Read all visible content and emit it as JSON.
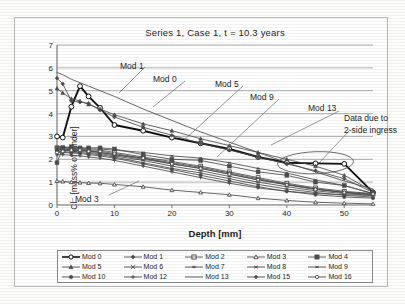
{
  "chart_data": {
    "type": "line",
    "title": "Series 1, Case 1, t = 10.3 years",
    "xlabel": "Depth [mm]",
    "ylabel": "Cl⁻ [mass% of binder]",
    "xlim": [
      0,
      55
    ],
    "ylim": [
      0,
      7
    ],
    "xticks": [
      0,
      10,
      20,
      30,
      40,
      50
    ],
    "yticks": [
      0,
      1,
      2,
      3,
      4,
      5,
      6,
      7
    ],
    "grid": "horizontal",
    "legend_position": "bottom",
    "x": [
      0,
      1,
      2.5,
      4,
      5.5,
      7.5,
      10,
      15,
      20,
      25,
      30,
      35,
      40,
      45,
      50,
      55
    ],
    "series": [
      {
        "name": "Mod 0",
        "marker": "circle-open",
        "values": [
          3.0,
          2.95,
          4.3,
          5.2,
          4.75,
          4.25,
          3.5,
          3.25,
          2.95,
          2.7,
          2.45,
          2.1,
          1.85,
          1.82,
          1.8,
          0.55
        ]
      },
      {
        "name": "Mod 1",
        "marker": "diamond",
        "values": [
          5.55,
          5.3,
          4.55,
          4.5,
          4.45,
          4.15,
          3.85,
          3.4,
          3.05,
          2.7,
          2.4,
          2.1,
          1.8,
          1.5,
          1.15,
          0.55
        ]
      },
      {
        "name": "Mod 2",
        "marker": "square-open",
        "values": [
          2.5,
          2.5,
          2.45,
          2.45,
          2.4,
          2.4,
          2.3,
          2.1,
          1.9,
          1.7,
          1.45,
          1.2,
          0.95,
          0.75,
          0.6,
          0.5
        ]
      },
      {
        "name": "Mod 3",
        "marker": "triangle-open",
        "values": [
          1.05,
          1.03,
          1.0,
          0.98,
          0.96,
          0.95,
          0.9,
          0.8,
          0.65,
          0.55,
          0.45,
          0.3,
          0.2,
          0.12,
          0.08,
          0.05
        ]
      },
      {
        "name": "Mod 4",
        "marker": "square-filled",
        "values": [
          1.85,
          2.5,
          2.55,
          2.5,
          2.5,
          2.5,
          2.45,
          2.2,
          2.0,
          1.95,
          1.7,
          1.45,
          1.3,
          1.0,
          0.85,
          0.5
        ]
      },
      {
        "name": "Mod 5",
        "marker": "triangle-filled",
        "values": [
          5.1,
          4.9,
          4.65,
          4.55,
          4.4,
          4.2,
          3.95,
          3.55,
          3.25,
          2.9,
          2.6,
          2.3,
          2.0,
          1.7,
          1.3,
          0.6
        ]
      },
      {
        "name": "Mod 6",
        "marker": "cross",
        "values": [
          2.45,
          2.45,
          2.4,
          2.4,
          2.35,
          2.3,
          2.2,
          2.0,
          1.8,
          1.6,
          1.35,
          1.1,
          0.9,
          0.7,
          0.55,
          0.45
        ]
      },
      {
        "name": "Mod 7",
        "marker": "bar",
        "values": [
          2.4,
          2.4,
          2.38,
          2.35,
          2.3,
          2.25,
          2.15,
          1.95,
          1.7,
          1.5,
          1.25,
          1.0,
          0.8,
          0.62,
          0.5,
          0.42
        ]
      },
      {
        "name": "Mod 8",
        "marker": "star",
        "values": [
          2.35,
          2.35,
          2.3,
          2.3,
          2.25,
          2.2,
          2.1,
          1.85,
          1.6,
          1.4,
          1.15,
          0.9,
          0.7,
          0.55,
          0.42,
          0.35
        ]
      },
      {
        "name": "Mod 9",
        "marker": "star-small",
        "values": [
          2.55,
          2.55,
          2.5,
          2.5,
          2.45,
          2.45,
          2.4,
          2.3,
          2.15,
          2.05,
          1.85,
          1.6,
          1.4,
          1.1,
          0.85,
          0.5
        ]
      },
      {
        "name": "Mod 10",
        "marker": "circle-filled",
        "values": [
          2.3,
          2.3,
          2.28,
          2.25,
          2.2,
          2.15,
          2.05,
          1.8,
          1.55,
          1.3,
          1.05,
          0.8,
          0.6,
          0.45,
          0.35,
          0.3
        ]
      },
      {
        "name": "Mod 12",
        "marker": "plus",
        "values": [
          2.2,
          2.2,
          2.18,
          2.15,
          2.1,
          2.05,
          1.95,
          1.7,
          1.45,
          1.2,
          0.95,
          0.75,
          0.6,
          0.5,
          0.45,
          0.42
        ]
      },
      {
        "name": "Mod 13",
        "marker": "none",
        "values": [
          5.8,
          5.7,
          5.5,
          5.35,
          5.2,
          5.0,
          4.75,
          4.2,
          3.7,
          3.2,
          2.75,
          2.3,
          1.85,
          1.45,
          1.05,
          0.7
        ]
      },
      {
        "name": "Mod 15",
        "marker": "diamond-small",
        "values": [
          2.45,
          2.45,
          2.42,
          2.4,
          2.35,
          2.3,
          2.2,
          2.05,
          1.85,
          1.65,
          1.4,
          1.15,
          0.9,
          0.7,
          0.55,
          0.45
        ]
      },
      {
        "name": "Mod 16",
        "marker": "circle-small",
        "values": [
          2.3,
          2.35,
          2.4,
          2.4,
          2.35,
          2.35,
          2.25,
          2.05,
          1.8,
          1.6,
          1.35,
          1.1,
          0.88,
          0.68,
          0.55,
          0.48
        ]
      }
    ],
    "annotations": [
      {
        "label": "Mod 1",
        "x": 63,
        "y": 16
      },
      {
        "label": "Mod 0",
        "x": 96,
        "y": 29
      },
      {
        "label": "Mod 5",
        "x": 158,
        "y": 34
      },
      {
        "label": "Mod 9",
        "x": 193,
        "y": 47
      },
      {
        "label": "Mod 13",
        "x": 251,
        "y": 58
      },
      {
        "label": "Data due to",
        "x": 287,
        "y": 68
      },
      {
        "label": "2-side ingress",
        "x": 287,
        "y": 80
      },
      {
        "label": "Mod 3",
        "x": 18,
        "y": 149
      }
    ]
  },
  "legend": {
    "items": [
      {
        "label": "Mod 0"
      },
      {
        "label": "Mod 1"
      },
      {
        "label": "Mod 2"
      },
      {
        "label": "Mod 3"
      },
      {
        "label": "Mod 4"
      },
      {
        "label": "Mod 5"
      },
      {
        "label": "Mod 6"
      },
      {
        "label": "Mod 7"
      },
      {
        "label": "Mod 8"
      },
      {
        "label": "Mod 9"
      },
      {
        "label": "Mod 10"
      },
      {
        "label": "Mod 12"
      },
      {
        "label": "Mod 13"
      },
      {
        "label": "Mod 15"
      },
      {
        "label": "Mod 16"
      }
    ]
  },
  "colors": {
    "line": "#4d4d4d",
    "emphasis": "#111111",
    "grid": "#9a9a9a",
    "axis": "#6e6e6e",
    "text": "#1d1d1d",
    "background": "#ffffff"
  }
}
